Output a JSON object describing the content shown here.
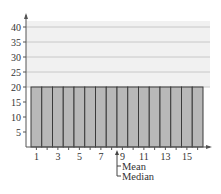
{
  "chart_data": {
    "type": "bar",
    "title": "",
    "xlabel": "",
    "ylabel": "",
    "categories": [
      1,
      2,
      3,
      4,
      5,
      6,
      7,
      8,
      9,
      10,
      11,
      12,
      13,
      14,
      15,
      16
    ],
    "values": [
      20,
      20,
      20,
      20,
      20,
      20,
      20,
      20,
      20,
      20,
      20,
      20,
      20,
      20,
      20,
      20
    ],
    "x_tick_labels": [
      "1",
      "3",
      "5",
      "7",
      "9",
      "11",
      "13",
      "15"
    ],
    "y_tick_labels": [
      "5",
      "10",
      "15",
      "20",
      "25",
      "30",
      "35",
      "40"
    ],
    "ylim": [
      0,
      42
    ],
    "grid": "horizontal lines at 20, 25, 30, 35, 40",
    "legend": null,
    "annotations": [
      {
        "label": "Mean",
        "x": 8.5
      },
      {
        "label": "Median",
        "x": 8.5
      }
    ],
    "colors": {
      "bar_fill": "#b8b8b8",
      "bar_edge": "#3a3a3a",
      "grid_band": "#f1f1f1",
      "grid_line": "#c8c8c8"
    }
  }
}
